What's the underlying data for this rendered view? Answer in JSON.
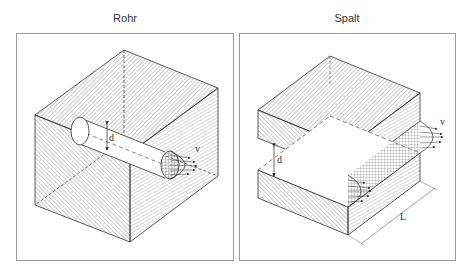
{
  "panels": [
    {
      "title": "Rohr",
      "labels": {
        "diameter": "d",
        "velocity": "v"
      }
    },
    {
      "title": "Spalt",
      "labels": {
        "gap": "d",
        "velocity": "v",
        "length": "L"
      }
    }
  ],
  "colors": {
    "border": "#9a9a9a",
    "line": "#333333",
    "hatch": "#555555"
  }
}
